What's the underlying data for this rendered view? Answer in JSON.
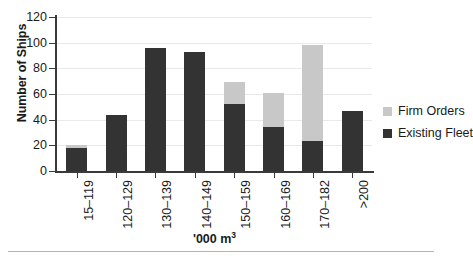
{
  "chart_data": {
    "type": "bar",
    "stacked": true,
    "title": "",
    "xlabel": "'000 m3",
    "xlabel_display": "'000 m",
    "xlabel_superscript": "3",
    "ylabel": "Number of Ships",
    "ylim": [
      0,
      120
    ],
    "yticks": [
      0,
      20,
      40,
      60,
      80,
      100,
      120
    ],
    "ytick_labels": [
      "0",
      "20",
      "40",
      "60",
      "80",
      "100",
      "120"
    ],
    "grid": true,
    "grid_axis": "y",
    "legend_position": "right",
    "categories": [
      "15–119",
      "120–129",
      "130–139",
      "140–149",
      "150–159",
      "160–169",
      "170–182",
      ">200"
    ],
    "series": [
      {
        "name": "Existing Fleet",
        "color": "#333333",
        "values": [
          18,
          44,
          96,
          93,
          52,
          34,
          23,
          47
        ]
      },
      {
        "name": "Firm Orders",
        "color": "#c8c8c8",
        "values": [
          2,
          0,
          0,
          0,
          17,
          27,
          75,
          0
        ]
      }
    ],
    "totals": [
      20,
      44,
      96,
      93,
      69,
      61,
      98,
      47
    ]
  },
  "legend": {
    "entries": [
      {
        "label": "Firm Orders",
        "color": "#c8c8c8"
      },
      {
        "label": "Existing Fleet",
        "color": "#333333"
      }
    ]
  },
  "axes": {
    "y_title": "Number of Ships",
    "x_title_text": "'000 m",
    "x_title_sup": "3"
  }
}
